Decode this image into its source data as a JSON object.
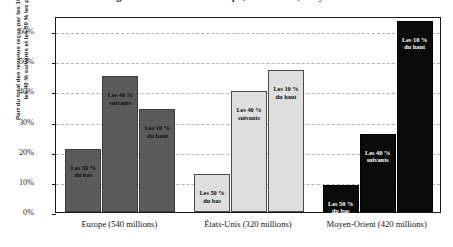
{
  "chart_data": {
    "type": "bar",
    "title": "Les inégalités de revenus : Europe, États-Unis, Moyen-Orient",
    "xlabel": "",
    "ylabel_line1": "Part du total des revenus reçus par les 10 % les plus riches,",
    "ylabel_line2": "les 40 % suivants et les 50 % les plus pauvres",
    "categories": [
      "Europe (540 millions)",
      "États-Unis (320 millions)",
      "Moyen-Orient (420 millions)"
    ],
    "series": [
      {
        "name": "Les 50 % du bas",
        "label_line1": "Les 50 %",
        "label_line2": "du bas",
        "values": [
          21,
          12.5,
          9
        ]
      },
      {
        "name": "Les 40 % suivants",
        "label_line1": "Les 40 %",
        "label_line2": "suivants",
        "values": [
          45,
          40,
          26
        ]
      },
      {
        "name": "Les 10 % du haut",
        "label_line1": "Les 10 %",
        "label_line2": "du haut",
        "values": [
          34,
          47,
          63.5
        ]
      }
    ],
    "ylim": [
      0,
      65
    ],
    "yticks": [
      0,
      10,
      20,
      30,
      40,
      50,
      60
    ],
    "ytick_labels": [
      "0%",
      "10%",
      "20%",
      "30%",
      "40%",
      "50%",
      "60%"
    ],
    "grid": true,
    "legend": "none",
    "group_colors": [
      "#5b5b5b",
      "#dedede",
      "#0b0b0b"
    ],
    "group_label_colors": [
      "dark",
      "dark",
      "light"
    ]
  }
}
